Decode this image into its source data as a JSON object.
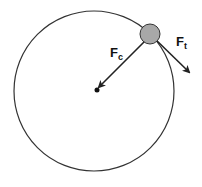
{
  "diagram": {
    "labels": {
      "centripetal": {
        "main": "F",
        "sub": "c"
      },
      "tangential": {
        "main": "F",
        "sub": "t"
      }
    },
    "colors": {
      "stroke": "#222222",
      "ball_fill": "#a8a8a8",
      "background": "#ffffff"
    }
  }
}
